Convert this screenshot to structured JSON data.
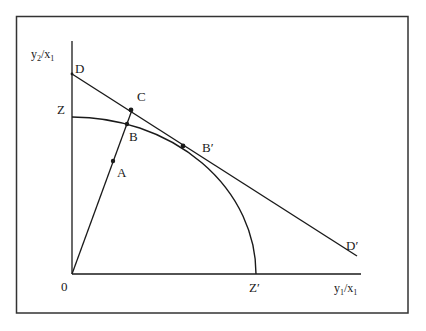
{
  "diagram": {
    "type": "production-possibility-frontier",
    "colors": {
      "background": "#ffffff",
      "ink": "#1a1a1a",
      "frame": "#333333"
    },
    "axes": {
      "y_label": {
        "base": "y",
        "sub1": "2",
        "slash": "/x",
        "sub2": "1"
      },
      "x_label": {
        "base": "y",
        "sub1": "1",
        "slash": "/x",
        "sub2": "1"
      },
      "origin_label": "0"
    },
    "points": {
      "D": "D",
      "C": "C",
      "Z": "Z",
      "B": "B",
      "B_prime": "B′",
      "A": "A",
      "Z_prime": "Z′",
      "D_prime": "D′"
    },
    "curves": [
      {
        "name": "frontier ZZ′",
        "from": "Z",
        "to": "Z′",
        "shape": "concave arc"
      },
      {
        "name": "line DD′",
        "from": "D",
        "to": "D′",
        "shape": "straight",
        "tangent_at": "B′"
      },
      {
        "name": "ray 0C",
        "from": "0",
        "through": [
          "A",
          "B"
        ],
        "to": "C",
        "shape": "straight"
      }
    ]
  }
}
